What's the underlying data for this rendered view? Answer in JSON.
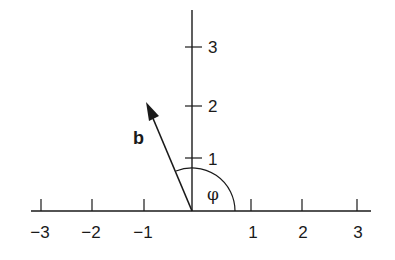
{
  "diagram": {
    "title": "",
    "vector": {
      "label": "b",
      "tip": [
        -0.9,
        2.1
      ],
      "color": "#1a1a1a"
    },
    "angle": {
      "label": "φ",
      "from_deg": 0,
      "to_deg": 112
    },
    "x_axis": {
      "ticks": [
        {
          "value": -3,
          "label": "−3"
        },
        {
          "value": -2,
          "label": "−2"
        },
        {
          "value": -1,
          "label": "−1"
        },
        {
          "value": 1,
          "label": "1"
        },
        {
          "value": 2,
          "label": "2"
        },
        {
          "value": 3,
          "label": "3"
        }
      ]
    },
    "y_axis": {
      "ticks": [
        {
          "value": 1,
          "label": "1"
        },
        {
          "value": 2,
          "label": "2"
        },
        {
          "value": 3,
          "label": "3"
        }
      ]
    }
  }
}
